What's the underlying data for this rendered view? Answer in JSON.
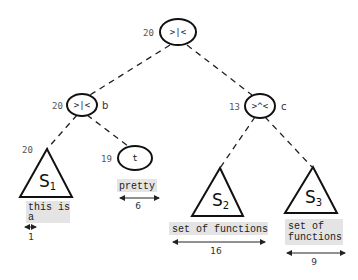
{
  "diagram": {
    "type": "tree",
    "nodes": {
      "root": {
        "weight": "20",
        "op": ">|<",
        "name": ""
      },
      "b": {
        "weight": "20",
        "op": ">|<",
        "name": "b"
      },
      "c": {
        "weight": "13",
        "op": ">^<",
        "name": "c"
      },
      "t": {
        "weight": "19",
        "op": "t"
      }
    },
    "subtrees": {
      "s1": {
        "weight": "20",
        "label": "S",
        "subscript": "1",
        "text_lines": [
          "this is",
          "a"
        ],
        "measure": "1"
      },
      "s2": {
        "label": "S",
        "subscript": "2",
        "text_lines": [
          "set of functions"
        ],
        "measure": "16"
      },
      "s3": {
        "label": "S",
        "subscript": "3",
        "text_lines": [
          "set of",
          "functions"
        ],
        "measure": "9"
      }
    },
    "leaf_t": {
      "text": "pretty",
      "measure": "6"
    },
    "edges": [
      [
        "root",
        "b"
      ],
      [
        "root",
        "c"
      ],
      [
        "b",
        "s1"
      ],
      [
        "b",
        "t"
      ],
      [
        "c",
        "s2"
      ],
      [
        "c",
        "s3"
      ]
    ],
    "colors": {
      "line": "#111111",
      "highlight": "#e4e4e4"
    }
  }
}
